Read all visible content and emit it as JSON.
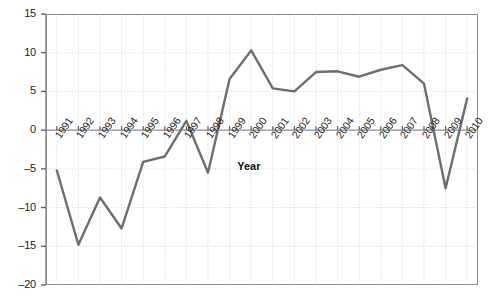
{
  "chart_data": {
    "type": "line",
    "title": "",
    "subtitle": "",
    "xlabel": "Year",
    "ylabel": "",
    "categories": [
      "1991",
      "1992",
      "1993",
      "1994",
      "1995",
      "1996",
      "1997",
      "1998",
      "1999",
      "2000",
      "2001",
      "2002",
      "2003",
      "2004",
      "2005",
      "2006",
      "2007",
      "2008",
      "2009",
      "2010"
    ],
    "x": [
      1991,
      1992,
      1993,
      1994,
      1995,
      1996,
      1997,
      1998,
      1999,
      2000,
      2001,
      2002,
      2003,
      2004,
      2005,
      2006,
      2007,
      2008,
      2009,
      2010
    ],
    "values": [
      -5.2,
      -14.8,
      -8.7,
      -12.7,
      -4.1,
      -3.4,
      1.2,
      -5.5,
      6.6,
      10.3,
      5.4,
      5.0,
      7.5,
      7.6,
      6.9,
      7.8,
      8.4,
      6.0,
      -7.5,
      4.1
    ],
    "series": [
      {
        "name": "series-1",
        "values": [
          -5.2,
          -14.8,
          -8.7,
          -12.7,
          -4.1,
          -3.4,
          1.2,
          -5.5,
          6.6,
          10.3,
          5.4,
          5.0,
          7.5,
          7.6,
          6.9,
          7.8,
          8.4,
          6.0,
          -7.5,
          4.1
        ],
        "color": "#6e6e6e"
      }
    ],
    "ylim": [
      -20,
      15
    ],
    "xlim": [
      1990.5,
      2010.5
    ],
    "yticks": [
      15,
      10,
      5,
      0,
      -5,
      -10,
      -15,
      -20
    ],
    "ytick_labels": [
      "15",
      "10",
      "5",
      "0",
      "–5",
      "–10",
      "–15",
      "–20"
    ],
    "grid": true,
    "grid_style": "dotted-light",
    "legend": false,
    "legend_position": "none",
    "zero_line": true,
    "axis_color": "#8b8b8b",
    "text_color": "#1a1a1a",
    "background": "#ffffff"
  }
}
